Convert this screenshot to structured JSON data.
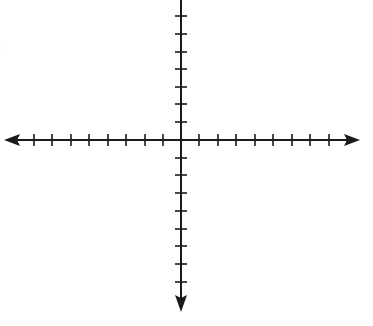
{
  "figure": {
    "label_fragment": ")",
    "type": "coordinate-plane",
    "origin": {
      "x": 181,
      "y": 140
    },
    "x_axis": {
      "left_end": 6,
      "right_end": 358,
      "ticks_left": [
        34,
        52,
        71,
        89,
        108,
        126,
        145,
        163
      ],
      "ticks_right": [
        199,
        218,
        236,
        255,
        273,
        292,
        310,
        329
      ],
      "arrows": [
        "left",
        "right"
      ]
    },
    "y_axis": {
      "top_end": 0,
      "bottom_end": 310,
      "ticks_up": [
        16,
        34,
        52,
        69,
        87,
        104,
        122
      ],
      "ticks_down": [
        158,
        175,
        193,
        211,
        229,
        246,
        264,
        282
      ],
      "arrows": [
        "down"
      ]
    },
    "colors": {
      "axis": "#1a1a1a",
      "background": "#ffffff"
    }
  }
}
